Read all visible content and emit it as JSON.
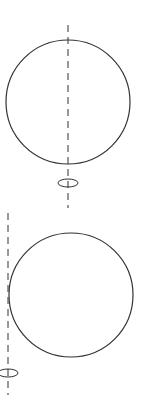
{
  "diagram": {
    "stroke_color": "#333333",
    "background": "#ffffff",
    "figures": [
      {
        "name": "sphere-rotating-about-diameter",
        "circle": {
          "cx": 68,
          "cy": 102,
          "r": 62
        },
        "axis": {
          "x": 68,
          "y1": 25,
          "y2": 208,
          "style": "dashed"
        },
        "rotation_symbol": {
          "cx": 68,
          "cy": 183,
          "rx": 10,
          "ry": 4
        }
      },
      {
        "name": "sphere-rotating-about-tangent-axis",
        "circle": {
          "cx": 71,
          "cy": 295,
          "r": 62
        },
        "axis": {
          "x": 8,
          "y1": 213,
          "y2": 395,
          "style": "dashed"
        },
        "rotation_symbol": {
          "cx": 8,
          "cy": 373,
          "rx": 10,
          "ry": 4
        }
      }
    ]
  }
}
